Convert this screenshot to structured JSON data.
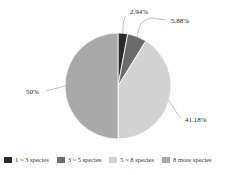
{
  "chart_data": {
    "type": "pie",
    "title": "",
    "categories": [
      "1 ~ 3 species",
      "3 ~ 5 species",
      "5 ~ 8 species",
      "8 more species"
    ],
    "values": [
      2.94,
      5.88,
      41.18,
      50
    ],
    "labels": [
      "2.94%",
      "5.88%",
      "41.18%",
      "50%"
    ],
    "colors": [
      "#2b2b2b",
      "#6b6b6b",
      "#d2d2d2",
      "#a9a9a9"
    ],
    "legend_position": "bottom",
    "start_angle": "12 o'clock, clockwise"
  },
  "legend": [
    {
      "label": "1 ~ 3 species",
      "color": "#2b2b2b"
    },
    {
      "label": "3 ~ 5 species",
      "color": "#6b6b6b"
    },
    {
      "label": "5 ~ 8 species",
      "color": "#d2d2d2"
    },
    {
      "label": "8 more species",
      "color": "#a9a9a9"
    }
  ]
}
